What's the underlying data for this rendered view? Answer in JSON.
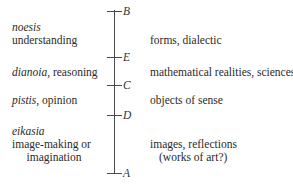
{
  "diagram": {
    "type": "divided-line",
    "points": [
      {
        "label": "B",
        "y": 11
      },
      {
        "label": "E",
        "y": 57
      },
      {
        "label": "C",
        "y": 85
      },
      {
        "label": "D",
        "y": 115
      },
      {
        "label": "A",
        "y": 173
      }
    ],
    "left_labels": {
      "noesis_term": "noesis",
      "noesis_desc": "understanding",
      "dianoia_term": "dianoia,",
      "dianoia_desc": " reasoning",
      "pistis_term": "pistis,",
      "pistis_desc": " opinion",
      "eikasia_term": "eikasia",
      "eikasia_desc_1": "image-making or",
      "eikasia_desc_2": "imagination"
    },
    "right_labels": {
      "noesis_objects": "forms, dialectic",
      "dianoia_objects": "mathematical realities, sciences",
      "pistis_objects": "objects of sense",
      "eikasia_objects_1": "images, reflections",
      "eikasia_objects_2": "(works of art?)"
    }
  }
}
